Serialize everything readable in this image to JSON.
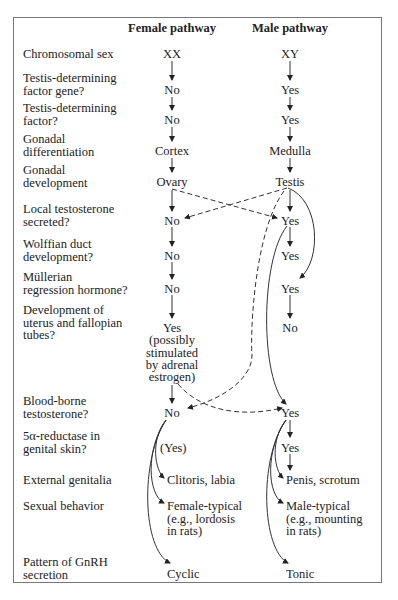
{
  "headers": {
    "female": "Female pathway",
    "male": "Male pathway"
  },
  "rows": [
    {
      "label": [
        "Chromosomal sex"
      ],
      "female": [
        "XX"
      ],
      "male": [
        "XY"
      ]
    },
    {
      "label": [
        "Testis-determining",
        "factor gene?"
      ],
      "female": [
        "No"
      ],
      "male": [
        "Yes"
      ]
    },
    {
      "label": [
        "Testis-determining",
        "factor?"
      ],
      "female": [
        "No"
      ],
      "male": [
        "Yes"
      ]
    },
    {
      "label": [
        "Gonadal",
        "differentiation"
      ],
      "female": [
        "Cortex"
      ],
      "male": [
        "Medulla"
      ]
    },
    {
      "label": [
        "Gonadal",
        "development"
      ],
      "female": [
        "Ovary"
      ],
      "male": [
        "Testis"
      ]
    },
    {
      "label": [
        "Local testosterone",
        "secreted?"
      ],
      "female": [
        "No"
      ],
      "male": [
        "Yes"
      ]
    },
    {
      "label": [
        "Wolffian duct",
        "development?"
      ],
      "female": [
        "No"
      ],
      "male": [
        "Yes"
      ]
    },
    {
      "label": [
        "Müllerian",
        "regression hormone?"
      ],
      "female": [
        "No"
      ],
      "male": [
        "Yes"
      ]
    },
    {
      "label": [
        "Development of",
        "uterus and fallopian",
        "tubes?"
      ],
      "female": [
        "Yes",
        "(possibly",
        "stimulated",
        "by adrenal",
        "estrogen)"
      ],
      "male": [
        "No"
      ]
    },
    {
      "label": [
        "Blood-borne",
        "testosterone?"
      ],
      "female": [
        "No"
      ],
      "male": [
        "Yes"
      ]
    },
    {
      "label": [
        "5α-reductase in",
        "genital skin?"
      ],
      "female": [
        "(Yes)"
      ],
      "male": [
        "Yes"
      ]
    },
    {
      "label": [
        "External genitalia"
      ],
      "female": [
        "Clitoris, labia"
      ],
      "male": [
        "Penis, scrotum"
      ]
    },
    {
      "label": [
        "Sexual behavior"
      ],
      "female": [
        "Female-typical",
        "(e.g., lordosis",
        "in rats)"
      ],
      "male": [
        "Male-typical",
        "(e.g., mounting",
        "in rats)"
      ]
    },
    {
      "label": [
        "Pattern of GnRH",
        "secretion"
      ],
      "female": [
        "Cyclic"
      ],
      "male": [
        "Tonic"
      ]
    }
  ]
}
